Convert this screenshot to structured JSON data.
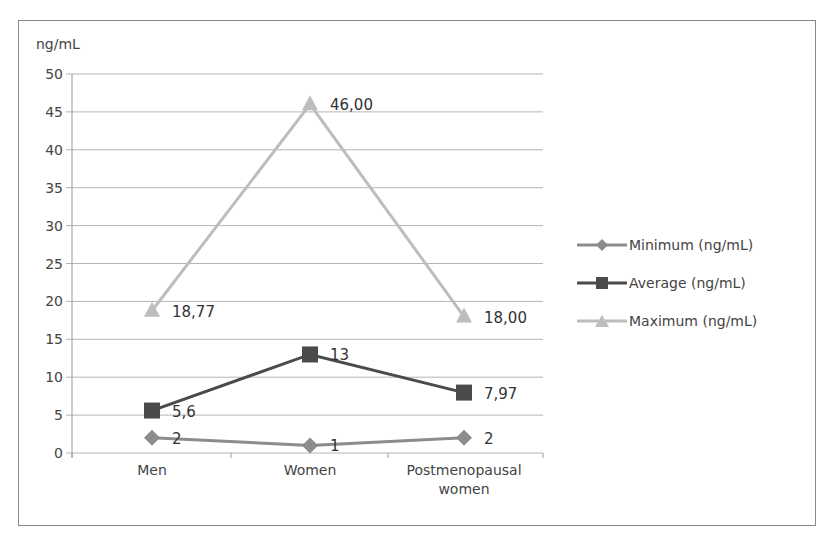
{
  "chart_data": {
    "type": "line",
    "title": "",
    "ylabel": "ng/mL",
    "xlabel": "",
    "ylim": [
      0,
      50
    ],
    "yticks": [
      "0",
      "5",
      "10",
      "15",
      "20",
      "25",
      "30",
      "35",
      "40",
      "45",
      "50"
    ],
    "grid": true,
    "legend_position": "right",
    "categories": [
      "Men",
      "Women",
      "Postmenopausal women"
    ],
    "series": [
      {
        "name": "Minimum (ng/mL)",
        "values": [
          2,
          1,
          2
        ],
        "labels": [
          "2",
          "1",
          "2"
        ],
        "color": "#8c8c8c",
        "marker": "diamond"
      },
      {
        "name": "Average (ng/mL)",
        "values": [
          5.6,
          13,
          7.97
        ],
        "labels": [
          "5,6",
          "13",
          "7,97"
        ],
        "color": "#4a4a4a",
        "marker": "square"
      },
      {
        "name": "Maximum (ng/mL)",
        "values": [
          18.77,
          46.0,
          18.0
        ],
        "labels": [
          "18,77",
          "46,00",
          "18,00"
        ],
        "color": "#bdbdbd",
        "marker": "triangle"
      }
    ]
  },
  "labels": {
    "unit": "ng/mL",
    "cat0": "Men",
    "cat1": "Women",
    "cat2a": "Postmenopausal",
    "cat2b": "women",
    "legend0": "Minimum (ng/mL)",
    "legend1": "Average (ng/mL)",
    "legend2": "Maximum (ng/mL)"
  }
}
